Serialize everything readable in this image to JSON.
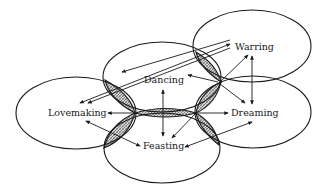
{
  "diagram": {
    "title": "",
    "nodes": [
      {
        "id": "warring",
        "label": "Warring"
      },
      {
        "id": "dancing",
        "label": "Dancing"
      },
      {
        "id": "lovemaking",
        "label": "Lovemaking"
      },
      {
        "id": "dreaming",
        "label": "Dreaming"
      },
      {
        "id": "feasting",
        "label": "Feasting"
      }
    ],
    "overlaps": [
      "dancing-warring",
      "dancing-lovemaking",
      "dancing-dreaming",
      "lovemaking-feasting",
      "dreaming-feasting",
      "lovemaking-dreaming (center)"
    ],
    "arrows": [
      {
        "from": "center",
        "to": "dancing",
        "type": "double"
      },
      {
        "from": "center-left",
        "to": "lovemaking"
      },
      {
        "from": "center-right",
        "to": "dreaming"
      },
      {
        "from": "center-right",
        "to": "warring"
      },
      {
        "from": "warring",
        "to": "dreaming",
        "type": "double"
      },
      {
        "from": "lovemaking",
        "to": "feasting"
      },
      {
        "from": "dreaming",
        "to": "feasting",
        "type": "double"
      },
      {
        "from": "dancing",
        "to": "warring"
      },
      {
        "from": "lovemaking",
        "to": "warring",
        "type": "double"
      },
      {
        "from": "center-right",
        "to": "feasting"
      },
      {
        "from": "center-right",
        "to": "dancing"
      }
    ],
    "colors": {
      "stroke": "#1a1a1a",
      "background": "#ffffff",
      "hatch": "#888888"
    }
  }
}
